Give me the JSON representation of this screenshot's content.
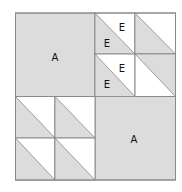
{
  "diagram": {
    "title": "",
    "colors": {
      "fill": "#dcdcdc",
      "stroke": "#8a8a8a",
      "background": "#ffffff",
      "text": "#111111"
    },
    "quadrants": {
      "top_left": {
        "label": "A",
        "type": "solid"
      },
      "bottom_right": {
        "label": "A",
        "type": "solid"
      },
      "top_right": {
        "type": "half-square-triangles",
        "cells": [
          {
            "position": "top-left",
            "gray": "bottom-left",
            "labels": [
              "E",
              "E"
            ]
          },
          {
            "position": "top-right",
            "gray": "bottom-left",
            "labels": []
          },
          {
            "position": "bottom-left",
            "gray": "bottom-left",
            "labels": [
              "E",
              "E"
            ]
          },
          {
            "position": "bottom-right",
            "gray": "top-right",
            "labels": []
          }
        ]
      },
      "bottom_left": {
        "type": "half-square-triangles",
        "cells": [
          {
            "position": "top-left",
            "gray": "bottom-left",
            "labels": []
          },
          {
            "position": "top-right",
            "gray": "bottom-left",
            "labels": []
          },
          {
            "position": "bottom-left",
            "gray": "bottom-left",
            "labels": []
          },
          {
            "position": "bottom-right",
            "gray": "bottom-left",
            "labels": []
          }
        ]
      }
    },
    "labels": {
      "a_top_left": "A",
      "a_bottom_right": "A",
      "e1_top": "E",
      "e1_bottom": "E",
      "e2_top": "E",
      "e2_bottom": "E"
    }
  }
}
